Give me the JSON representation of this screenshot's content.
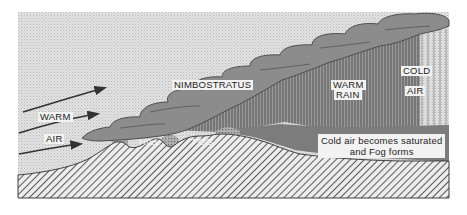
{
  "diagram": {
    "type": "warm-front-precipitation-fog cross-section",
    "labels": {
      "warm": "WARM",
      "air_left": "AIR",
      "nimbostratus": "NIMBOSTRATUS",
      "hill": "HILL",
      "fog": "FOG",
      "warm_rain_1": "WARM",
      "warm_rain_2": "RAIN",
      "cold": "COLD",
      "air_right": "AIR",
      "caption_1": "Cold air becomes saturated",
      "caption_2": "and Fog forms"
    },
    "colors": {
      "sky": "#d9d9d9",
      "cloud": "#8a8a8a",
      "cloud_edge": "#555555",
      "rain": "#6e6e6e",
      "fog_layer": "#7a7a7a",
      "ground_hatch": "#555555",
      "ground_bg": "#e8e8e8",
      "arrow": "#333333",
      "label_bg": "#f2f2f2"
    },
    "arrows": [
      {
        "name": "warm-air-arrow-top"
      },
      {
        "name": "warm-air-arrow-middle"
      },
      {
        "name": "warm-air-arrow-bottom"
      }
    ]
  }
}
